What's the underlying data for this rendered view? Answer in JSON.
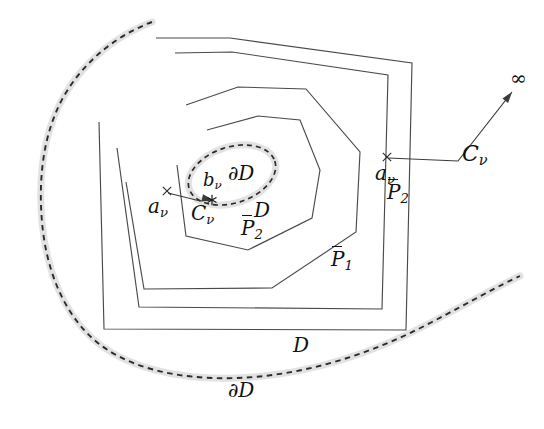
{
  "figure": {
    "background_color": "#ffffff",
    "line_color": "#4a4a4a",
    "halo_color": "#e2e2e2",
    "dash_color": "#2b2b2b",
    "width": 544,
    "height": 429
  },
  "labels": {
    "a_nu_left": {
      "base": "a",
      "sub": "ν",
      "overline": false
    },
    "a_nu_right": {
      "base": "a",
      "sub": "ν",
      "overline": false
    },
    "b_nu": {
      "base": "b",
      "sub": "ν",
      "overline": false
    },
    "c_nu_inner": {
      "base": "C",
      "sub": "ν",
      "overline": false
    },
    "c_nu_outer": {
      "base": "C",
      "sub": "ν",
      "overline": false
    },
    "d_center": {
      "base": "D",
      "sub": "",
      "overline": false
    },
    "d_bottom": {
      "base": "D",
      "sub": "",
      "overline": false
    },
    "del_d_ellipse": {
      "base": "∂D",
      "sub": "",
      "overline": false
    },
    "del_d_bottom": {
      "base": "∂D",
      "sub": "",
      "overline": false
    },
    "p_bar_2_inner": {
      "base": "P",
      "sub": "2",
      "overline": true
    },
    "p_bar_2_outer": {
      "base": "P",
      "sub": "2",
      "overline": true
    },
    "p_bar_1": {
      "base": "P",
      "sub": "1",
      "overline": true
    },
    "infinity": {
      "base": "∞",
      "sub": "",
      "overline": false
    }
  },
  "shapes": {
    "outer_boundary_dashed": {
      "name": "∂D",
      "style": "dashed-with-halo",
      "path": "M 152 22 C 120 34 86 58 64 96 C 44 131 38 176 42 222 C 46 268 62 310 92 338 C 124 367 176 380 236 378 C 300 376 368 356 432 322 C 470 302 500 285 520 276"
    },
    "inner_boundary_dashed": {
      "name": "∂D",
      "style": "dashed-ellipse-with-halo",
      "cx": 232,
      "cy": 175,
      "rx": 45,
      "ry": 28,
      "rotation": -18
    },
    "polygons": [
      {
        "name": "P̅1-outer-most",
        "points": "156 38 230 38 412 63 406 330 104 329 99 122"
      },
      {
        "name": "P̅1",
        "points": "175 53 232 52 388 75 382 309 139 307 117 148"
      },
      {
        "name": "P̅2-outer",
        "points": "186 105 238 87 306 89 360 152 356 232 272 288 144 289 126 182"
      },
      {
        "name": "P̅2-inner",
        "points": "207 130 258 116 300 120 320 170 312 218 248 250 186 236 177 165"
      }
    ],
    "connectors": [
      {
        "name": "a-to-C-inner",
        "path": "M 168 193 L 200 201 L 213 200",
        "arrow_at": [
          213,
          200
        ],
        "arrow_angle": 12
      },
      {
        "name": "a-to-infinity",
        "path": "M 388 158 L 458 161 L 512 92",
        "arrow_at": [
          512,
          92
        ],
        "arrow_angle": -52
      }
    ],
    "markers": [
      {
        "name": "cross-a-nu-left",
        "type": "x",
        "x": 167,
        "y": 191
      },
      {
        "name": "cross-a-nu-right",
        "type": "x",
        "x": 387,
        "y": 157
      },
      {
        "name": "star-C-nu",
        "type": "star",
        "x": 212,
        "y": 200
      }
    ]
  },
  "label_positions": {
    "a_nu_left": {
      "left": 148,
      "top": 196,
      "size": "sz-md"
    },
    "a_nu_right": {
      "left": 375,
      "top": 163,
      "size": "sz-md"
    },
    "b_nu": {
      "left": 203,
      "top": 171,
      "size": "sz-sm"
    },
    "c_nu_inner": {
      "left": 191,
      "top": 203,
      "size": "sz-md"
    },
    "c_nu_outer": {
      "left": 462,
      "top": 143,
      "size": "sz-lg"
    },
    "d_center": {
      "left": 254,
      "top": 200,
      "size": "sz-md"
    },
    "d_bottom": {
      "left": 293,
      "top": 335,
      "size": "sz-md"
    },
    "del_d_ellipse": {
      "left": 228,
      "top": 163,
      "size": "sz-md"
    },
    "del_d_bottom": {
      "left": 228,
      "top": 380,
      "size": "sz-md"
    },
    "p_bar_2_inner": {
      "left": 241,
      "top": 218,
      "size": "sz-md"
    },
    "p_bar_2_outer": {
      "left": 387,
      "top": 182,
      "size": "sz-md"
    },
    "p_bar_1": {
      "left": 331,
      "top": 249,
      "size": "sz-md"
    },
    "infinity": {
      "left": 510,
      "top": 68,
      "size": "sz-md"
    }
  }
}
